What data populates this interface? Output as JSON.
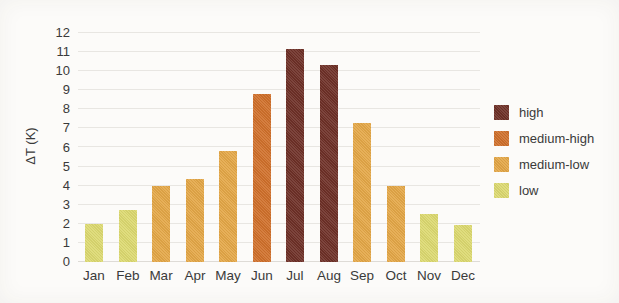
{
  "chart_data": {
    "type": "bar",
    "title": "",
    "xlabel": "",
    "ylabel": "ΔT (K)",
    "ylim": [
      0,
      12
    ],
    "yticks": [
      0,
      1,
      2,
      3,
      4,
      5,
      6,
      7,
      8,
      9,
      10,
      11,
      12
    ],
    "grid": true,
    "categories": [
      "Jan",
      "Feb",
      "Mar",
      "Apr",
      "May",
      "Jun",
      "Jul",
      "Aug",
      "Sep",
      "Oct",
      "Nov",
      "Dec"
    ],
    "values": [
      2.0,
      2.75,
      4.0,
      4.35,
      5.8,
      8.8,
      11.15,
      10.3,
      7.3,
      4.0,
      2.5,
      1.95
    ],
    "bar_categories": [
      "low",
      "low",
      "medium-low",
      "medium-low",
      "medium-low",
      "medium-high",
      "high",
      "high",
      "medium-low",
      "medium-low",
      "low",
      "low"
    ],
    "category_colors": {
      "high": "#6e3027",
      "medium-high": "#d0702b",
      "medium-low": "#e4a747",
      "low": "#dcd970"
    },
    "legend": {
      "position": "right",
      "entries": [
        {
          "label": "high",
          "color": "#6e3027"
        },
        {
          "label": "medium-high",
          "color": "#d0702b"
        },
        {
          "label": "medium-low",
          "color": "#e4a747"
        },
        {
          "label": "low",
          "color": "#dcd970"
        }
      ]
    },
    "style": {
      "gridline_color": "#e8e6e2",
      "text_color": "#3a3a3a",
      "background": "#fcfbf9"
    }
  }
}
